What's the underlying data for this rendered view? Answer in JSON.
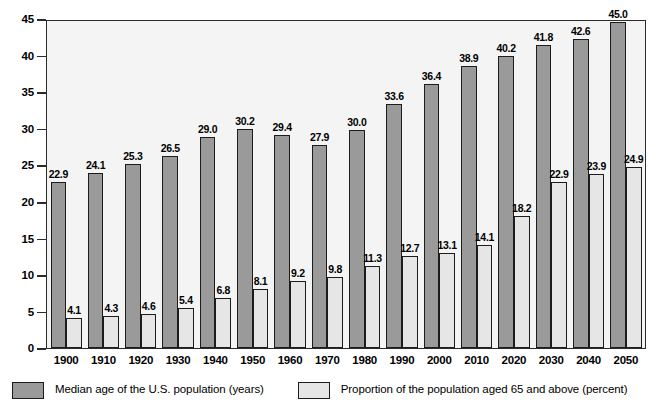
{
  "chart_data": {
    "type": "bar",
    "title": "",
    "xlabel": "",
    "ylabel": "",
    "ylim": [
      0,
      45
    ],
    "yticks": [
      45,
      40,
      35,
      30,
      25,
      20,
      15,
      10,
      5,
      0
    ],
    "grid": false,
    "legend_position": "bottom",
    "categories": [
      "1900",
      "1910",
      "1920",
      "1930",
      "1940",
      "1950",
      "1960",
      "1970",
      "1980",
      "1990",
      "2000",
      "2010",
      "2020",
      "2030",
      "2040",
      "2050"
    ],
    "series": [
      {
        "name": "Median age of the U.S. population (years)",
        "color": "#9a9a9a",
        "values": [
          22.9,
          24.1,
          25.3,
          26.5,
          29.0,
          30.2,
          29.4,
          27.9,
          30.0,
          33.6,
          36.4,
          38.9,
          40.2,
          41.8,
          42.6,
          45.0
        ],
        "labels": [
          "22.9",
          "24.1",
          "25.3",
          "26.5",
          "29.0",
          "30.2",
          "29.4",
          "27.9",
          "30.0",
          "33.6",
          "36.4",
          "38.9",
          "40.2",
          "41.8",
          "42.6",
          "45.0"
        ]
      },
      {
        "name": "Proportion of the population aged 65 and above (percent)",
        "color": "#e6e6e6",
        "values": [
          4.1,
          4.3,
          4.6,
          5.4,
          6.8,
          8.1,
          9.2,
          9.8,
          11.3,
          12.7,
          13.1,
          14.1,
          18.2,
          22.9,
          23.9,
          24.9
        ],
        "labels": [
          "4.1",
          "4.3",
          "4.6",
          "5.4",
          "6.8",
          "8.1",
          "9.2",
          "9.8",
          "11.3",
          "12.7",
          "13.1",
          "14.1",
          "18.2",
          "22.9",
          "23.9",
          "24.9"
        ]
      }
    ]
  },
  "legend": {
    "items": [
      {
        "label": "Median age of the U.S. population (years)",
        "swatch": "dark"
      },
      {
        "label": "Proportion of the population aged 65 and above (percent)",
        "swatch": "light"
      }
    ]
  }
}
